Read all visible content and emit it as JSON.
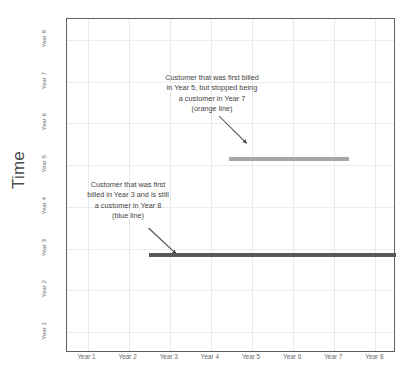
{
  "chart_data": {
    "type": "line",
    "title": "",
    "xlabel": "",
    "ylabel": "Time",
    "grid": true,
    "legend": "none",
    "x_tick_labels": [
      "Year 1",
      "Year 2",
      "Year 3",
      "Year 4",
      "Year 5",
      "Year 6",
      "Year 7",
      "Year 8"
    ],
    "y_tick_labels": [
      "Year 1",
      "Year 2",
      "Year 3",
      "Year 4",
      "Year 5",
      "Year 6",
      "Year 7",
      "Year 8"
    ],
    "xlim": [
      0.5,
      8.5
    ],
    "ylim": [
      0.5,
      8.5
    ],
    "series": [
      {
        "name": "blue line",
        "color": "#595959",
        "description": "Customer that was first billed in Year 3 and is still a customer in Year 8",
        "y_value": 2.85,
        "x_start": 2.5,
        "x_end": 8.5,
        "points": [
          [
            2.5,
            2.85
          ],
          [
            8.5,
            2.85
          ]
        ]
      },
      {
        "name": "orange line",
        "color": "#a6a6a6",
        "description": "Customer that was first billed in Year 5, but stopped being a customer in Year 7",
        "y_value": 5.15,
        "x_start": 4.45,
        "x_end": 7.35,
        "points": [
          [
            4.45,
            5.15
          ],
          [
            7.35,
            5.15
          ]
        ]
      }
    ],
    "annotations": [
      {
        "id": "orange-annotation",
        "lines": [
          "Customer that was first billed",
          "in Year 5, but stopped being",
          "a customer in Year 7",
          "(orange line)"
        ],
        "arrow_target": "orange line left endpoint"
      },
      {
        "id": "blue-annotation",
        "lines": [
          "Customer that was first",
          "billed in Year 3 and is still",
          "a customer in Year 8",
          "(blue line)"
        ],
        "arrow_target": "blue line left endpoint"
      }
    ]
  },
  "axis": {
    "y_title": "Time"
  },
  "colors": {
    "frame": "#5e5e5e",
    "gridline": "#e8e8e8",
    "background": "#ffffff",
    "tick_text": "#6b6b6b",
    "annotation_text": "#3f3f3f",
    "arrow": "#4a4a4a"
  }
}
